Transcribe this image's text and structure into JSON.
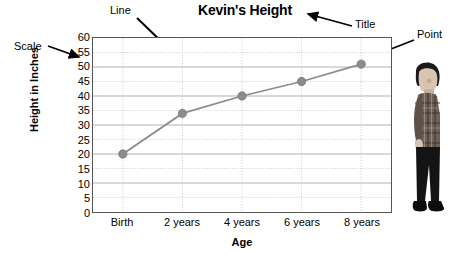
{
  "chart_data": {
    "type": "line",
    "title": "Kevin's Height",
    "xlabel": "Age",
    "ylabel": "Height in Inches",
    "categories": [
      "Birth",
      "2 years",
      "4 years",
      "6 years",
      "8 years"
    ],
    "values": [
      20,
      34,
      40,
      45,
      51
    ],
    "ylim": [
      0,
      60
    ],
    "ytick_step": 5,
    "yticks": [
      60,
      55,
      50,
      45,
      40,
      35,
      30,
      25,
      20,
      15,
      10,
      5,
      0
    ],
    "grid": true,
    "legend": "none",
    "series_color": "#8c8c8c",
    "marker": "circle",
    "annotations": [
      {
        "label": "Scale",
        "target": "y-axis-tick-labels"
      },
      {
        "label": "Line",
        "target": "data-line"
      },
      {
        "label": "Title",
        "target": "chart-title"
      },
      {
        "label": "Point",
        "target": "data-point-8-years"
      }
    ]
  },
  "colors": {
    "line": "#8c8c8c",
    "point": "#8c8c8c",
    "grid_major": "#b0b0b0",
    "grid_minor": "#c9c9c9",
    "frame": "#555555",
    "text": "#000000"
  },
  "image": {
    "photo_alt": "boy-standing-profile"
  }
}
